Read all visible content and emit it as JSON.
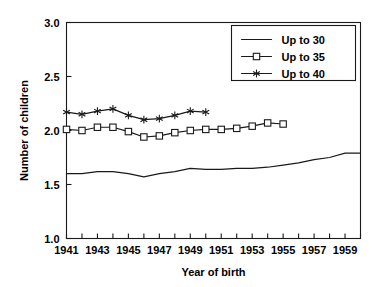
{
  "chart_data": {
    "type": "line",
    "title": "",
    "xlabel": "Year of birth",
    "ylabel": "Number of children",
    "xlim": [
      1941,
      1960
    ],
    "ylim": [
      1.0,
      3.0
    ],
    "grid": false,
    "legend_position": "top-right",
    "y_ticks": [
      "3.0",
      "2.5",
      "2.0",
      "1.5",
      "1.0"
    ],
    "y_tick_values": [
      3.0,
      2.5,
      2.0,
      1.5,
      1.0
    ],
    "x_ticks": [
      "1941",
      "1943",
      "1945",
      "1947",
      "1949",
      "1951",
      "1953",
      "1955",
      "1957",
      "1959"
    ],
    "x_tick_values": [
      1941,
      1943,
      1945,
      1947,
      1949,
      1951,
      1953,
      1955,
      1957,
      1959
    ],
    "x_minor_ticks": [
      1941,
      1942,
      1943,
      1944,
      1945,
      1946,
      1947,
      1948,
      1949,
      1950,
      1951,
      1952,
      1953,
      1954,
      1955,
      1956,
      1957,
      1958,
      1959,
      1960
    ],
    "series": [
      {
        "name": "Up to 30",
        "marker": "none",
        "x": [
          1941,
          1942,
          1943,
          1944,
          1945,
          1946,
          1947,
          1948,
          1949,
          1950,
          1951,
          1952,
          1953,
          1954,
          1955,
          1956,
          1957,
          1958,
          1959,
          1960
        ],
        "values": [
          1.6,
          1.6,
          1.62,
          1.62,
          1.6,
          1.57,
          1.6,
          1.62,
          1.65,
          1.64,
          1.64,
          1.65,
          1.65,
          1.66,
          1.68,
          1.7,
          1.73,
          1.75,
          1.79,
          1.79
        ]
      },
      {
        "name": "Up to 35",
        "marker": "square",
        "x": [
          1941,
          1942,
          1943,
          1944,
          1945,
          1946,
          1947,
          1948,
          1949,
          1950,
          1951,
          1952,
          1953,
          1954,
          1955
        ],
        "values": [
          2.01,
          2.0,
          2.03,
          2.03,
          1.99,
          1.94,
          1.95,
          1.98,
          2.0,
          2.01,
          2.01,
          2.02,
          2.04,
          2.07,
          2.06
        ]
      },
      {
        "name": "Up to 40",
        "marker": "star",
        "x": [
          1941,
          1942,
          1943,
          1944,
          1945,
          1946,
          1947,
          1948,
          1949,
          1950
        ],
        "values": [
          2.17,
          2.15,
          2.18,
          2.2,
          2.14,
          2.1,
          2.11,
          2.14,
          2.18,
          2.17
        ]
      }
    ]
  },
  "legend": {
    "entries": [
      {
        "label": "Up to 30"
      },
      {
        "label": "Up to 35"
      },
      {
        "label": "Up to 40"
      }
    ]
  }
}
